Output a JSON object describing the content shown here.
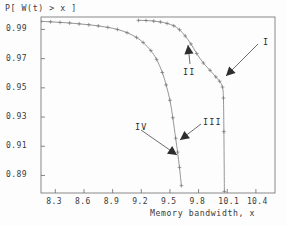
{
  "chart_data": {
    "type": "line",
    "title": "",
    "xlabel": "Memory bandwidth, x",
    "ylabel": "P[ W(t) > x ]",
    "xlim": [
      8.15,
      10.6
    ],
    "ylim": [
      0.878,
      0.9985
    ],
    "xticks": [
      "8.3",
      "8.6",
      "8.9",
      "9.2",
      "9.5",
      "9.8",
      "10.1",
      "10.4"
    ],
    "xtick_values": [
      8.3,
      8.6,
      8.9,
      9.2,
      9.5,
      9.8,
      10.1,
      10.4
    ],
    "yticks": [
      "0.89",
      "0.91",
      "0.93",
      "0.95",
      "0.97",
      "0.99"
    ],
    "ytick_values": [
      0.89,
      0.91,
      0.93,
      0.95,
      0.97,
      0.99
    ],
    "grid": false,
    "legend": "none",
    "marker": "plus",
    "series": [
      {
        "name": "curve-left",
        "x": [
          8.15,
          8.25,
          8.35,
          8.45,
          8.55,
          8.65,
          8.75,
          8.85,
          8.95,
          9.05,
          9.15,
          9.22,
          9.3,
          9.36,
          9.42,
          9.46,
          9.5,
          9.53,
          9.56,
          9.58,
          9.6,
          9.62
        ],
        "y": [
          0.9955,
          0.9952,
          0.9948,
          0.9944,
          0.9938,
          0.9932,
          0.9924,
          0.9914,
          0.99,
          0.9878,
          0.9845,
          0.981,
          0.9755,
          0.9695,
          0.9605,
          0.952,
          0.9415,
          0.9295,
          0.9155,
          0.906,
          0.8955,
          0.883
        ]
      },
      {
        "name": "curve-right",
        "x": [
          9.17,
          9.25,
          9.33,
          9.4,
          9.47,
          9.54,
          9.6,
          9.66,
          9.72,
          9.78,
          9.85,
          9.92,
          9.98,
          10.02,
          10.05,
          10.06,
          10.065,
          10.07
        ],
        "y": [
          0.9962,
          0.9961,
          0.9957,
          0.9951,
          0.9941,
          0.9925,
          0.9898,
          0.9855,
          0.98,
          0.9735,
          0.967,
          0.962,
          0.9575,
          0.9545,
          0.9505,
          0.943,
          0.92,
          0.879
        ]
      }
    ],
    "annotations": [
      {
        "id": "I",
        "label": "I",
        "text_x": 263,
        "text_y": 37,
        "tip_x": 226,
        "tip_y": 76,
        "tail_x": 258,
        "tail_y": 44
      },
      {
        "id": "II",
        "label": "II",
        "text_x": 183,
        "text_y": 67,
        "tip_x": 188,
        "tip_y": 45,
        "tail_x": 190,
        "tail_y": 64
      },
      {
        "id": "III",
        "label": "III",
        "text_x": 203,
        "text_y": 117,
        "tip_x": 180,
        "tip_y": 140,
        "tail_x": 201,
        "tail_y": 124
      },
      {
        "id": "IV",
        "label": "IV",
        "text_x": 135,
        "text_y": 122,
        "tip_x": 177,
        "tip_y": 155,
        "tail_x": 141,
        "tail_y": 130
      }
    ]
  },
  "colors": {
    "axis": "#6b6b6b",
    "curve": "#8a8a8a",
    "marker": "#767676",
    "annotation": "#2e2e2e",
    "text": "#3b3b3b",
    "background": "#fdfdfd"
  }
}
